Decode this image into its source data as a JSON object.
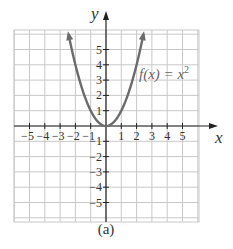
{
  "chart_data": {
    "type": "line",
    "title": "",
    "function_label": "f(x) = x²",
    "function_label_parts": {
      "lhs": "f(x)",
      "eq": "=",
      "base": "x",
      "exp": "2"
    },
    "xlabel": "x",
    "ylabel": "y",
    "xlim": [
      -6,
      6
    ],
    "ylim": [
      -6,
      6
    ],
    "grid": true,
    "x_ticks": [
      -5,
      -4,
      -3,
      -2,
      -1,
      1,
      2,
      3,
      4,
      5
    ],
    "y_ticks": [
      -5,
      -4,
      -3,
      -2,
      -1,
      1,
      2,
      3,
      4,
      5
    ],
    "x_tick_labels": [
      "−5",
      "−4",
      "−3",
      "−2",
      "−1",
      "1",
      "2",
      "3",
      "4",
      "5"
    ],
    "y_tick_labels": [
      "5",
      "4",
      "3",
      "2",
      "1",
      "1",
      "2",
      "3",
      "4",
      "5"
    ],
    "series": [
      {
        "name": "f(x) = x^2",
        "x": [
          -2.45,
          -2,
          -1.5,
          -1,
          -0.5,
          0,
          0.5,
          1,
          1.5,
          2,
          2.45
        ],
        "y": [
          6.0,
          4,
          2.25,
          1,
          0.25,
          0,
          0.25,
          1,
          2.25,
          4,
          6.0
        ],
        "arrows_at_ends": true
      }
    ],
    "caption": "(a)"
  },
  "colors": {
    "curve": "#6b6b6b",
    "grid": "#c8c8c8",
    "axis": "#222222",
    "text": "#333333"
  }
}
